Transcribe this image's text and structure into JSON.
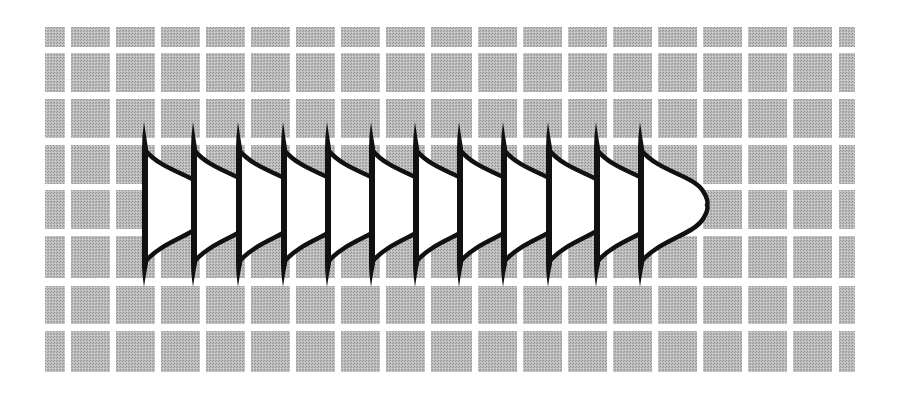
{
  "figure": {
    "width": 901,
    "height": 395
  },
  "colors": {
    "background": "#ffffff",
    "cell_gray": "#b9b9b9",
    "cell_dot_dark": "#8e8e8e",
    "cell_dot_light": "#d6d6d6",
    "grid_line": "#ffffff",
    "shape_fill": "#ffffff",
    "shape_stroke": "#111111"
  },
  "grid": {
    "columns": [
      [
        45,
        65
      ],
      [
        71,
        110
      ],
      [
        116,
        155
      ],
      [
        161,
        200
      ],
      [
        206,
        245
      ],
      [
        251,
        290
      ],
      [
        296,
        335
      ],
      [
        341,
        380
      ],
      [
        386,
        425
      ],
      [
        431,
        472
      ],
      [
        478,
        517
      ],
      [
        523,
        562
      ],
      [
        568,
        607
      ],
      [
        613,
        652
      ],
      [
        658,
        697
      ],
      [
        703,
        742
      ],
      [
        748,
        787
      ],
      [
        793,
        832
      ],
      [
        839,
        855
      ]
    ],
    "rows": [
      [
        27,
        47
      ],
      [
        53,
        92
      ],
      [
        99,
        138
      ],
      [
        145,
        184
      ],
      [
        190,
        229
      ],
      [
        236,
        278
      ],
      [
        286,
        324
      ],
      [
        331,
        372
      ]
    ],
    "artifact_line_y": 80
  },
  "shapes": {
    "count": 12,
    "stem_x": [
      145,
      194,
      239,
      284,
      328,
      372,
      416,
      460,
      504,
      549,
      597,
      641
    ],
    "spike_top_y": 122,
    "spike_bottom_y": 287,
    "body_top_y": 150,
    "body_bottom_y": 262,
    "tip_offset_x": 66,
    "tip_y": 205,
    "stroke_width": 4.5
  }
}
